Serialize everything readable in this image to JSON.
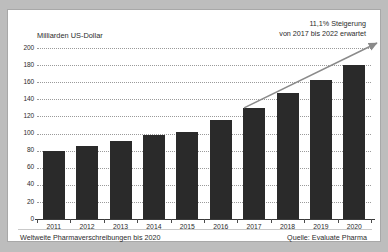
{
  "chart_data": {
    "type": "bar",
    "title": "",
    "xlabel": "",
    "ylabel": "Milliarden US-Dollar",
    "categories": [
      "2011",
      "2012",
      "2013",
      "2014",
      "2015",
      "2016",
      "2017",
      "2018",
      "2019",
      "2020"
    ],
    "values": [
      80,
      85,
      91,
      98,
      102,
      116,
      130,
      147,
      163,
      180
    ],
    "ylim": [
      0,
      200
    ],
    "yticks": [
      0,
      20,
      40,
      60,
      80,
      100,
      120,
      140,
      160,
      180,
      200
    ],
    "grid": true,
    "legend": "none",
    "bar_color": "#2a2a2a",
    "grid_color": "#9a9a9a",
    "annotations": [
      {
        "name": "growth-annotation",
        "line1": "11,1% Steigerung",
        "line2": "von 2017 bis 2022 erwartet",
        "arrow_from_category": "2017",
        "arrow_from_value": 130,
        "arrow_to_value": 200,
        "arrow_color": "#8a8a8a"
      }
    ]
  },
  "footer": {
    "caption": "Weltweite Pharmaverschreibungen bis 2020",
    "source": "Quelle: Evaluate Pharma"
  }
}
